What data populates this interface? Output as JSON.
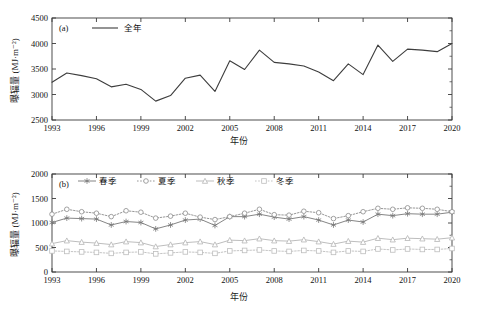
{
  "figure": {
    "background": "#ffffff",
    "axis_color": "#3a3a3a"
  },
  "panel_a": {
    "tag": "(a)",
    "ylabel": "曝辐量 (MJ·m⁻²)",
    "xlabel": "年份",
    "legend": [
      {
        "label": "全年",
        "color": "#3d3d3d",
        "marker": "none",
        "line": "solid"
      }
    ],
    "y_ticks": [
      "2500",
      "3000",
      "3500",
      "4000",
      "4500"
    ],
    "x_ticks": [
      "1993",
      "1996",
      "1999",
      "2002",
      "2005",
      "2008",
      "2011",
      "2014",
      "2017",
      "2020"
    ]
  },
  "panel_b": {
    "tag": "(b)",
    "ylabel": "曝辐量 (MJ·m⁻²)",
    "xlabel": "年份",
    "legend": [
      {
        "label": "春季",
        "color": "#777777",
        "marker": "star",
        "line": "solid"
      },
      {
        "label": "夏季",
        "color": "#8c8c8c",
        "marker": "circle",
        "line": "dotted"
      },
      {
        "label": "秋季",
        "color": "#b5b5b5",
        "marker": "triangle",
        "line": "solid"
      },
      {
        "label": "冬季",
        "color": "#bdbdbd",
        "marker": "square",
        "line": "dotted"
      }
    ],
    "y_ticks": [
      "0",
      "500",
      "1000",
      "1500",
      "2000"
    ],
    "x_ticks": [
      "1993",
      "1996",
      "1999",
      "2002",
      "2005",
      "2008",
      "2011",
      "2014",
      "2017",
      "2020"
    ]
  },
  "chart_data": [
    {
      "type": "line",
      "panel": "(a)",
      "title": "",
      "xlabel": "年份",
      "ylabel": "曝辐量 (MJ·m⁻²)",
      "xlim": [
        1993,
        2020
      ],
      "ylim": [
        2500,
        4500
      ],
      "ytick_step": 500,
      "xtick_step": 3,
      "grid": false,
      "legend_position": "top-left-inside",
      "x": [
        1993,
        1994,
        1995,
        1996,
        1997,
        1998,
        1999,
        2000,
        2001,
        2002,
        2003,
        2004,
        2005,
        2006,
        2007,
        2008,
        2009,
        2010,
        2011,
        2012,
        2013,
        2014,
        2015,
        2016,
        2017,
        2018,
        2019,
        2020
      ],
      "series": [
        {
          "name": "全年",
          "color": "#3d3d3d",
          "values": [
            3240,
            3420,
            3370,
            3310,
            3150,
            3200,
            3100,
            2870,
            2980,
            3320,
            3380,
            3060,
            3660,
            3490,
            3870,
            3630,
            3600,
            3560,
            3440,
            3270,
            3600,
            3390,
            3970,
            3650,
            3890,
            3870,
            3840,
            4000
          ]
        }
      ]
    },
    {
      "type": "line",
      "panel": "(b)",
      "title": "",
      "xlabel": "年份",
      "ylabel": "曝辐量 (MJ·m⁻²)",
      "xlim": [
        1993,
        2020
      ],
      "ylim": [
        0,
        2000
      ],
      "ytick_step": 500,
      "xtick_step": 3,
      "grid": false,
      "legend_position": "top-inside",
      "x": [
        1993,
        1994,
        1995,
        1996,
        1997,
        1998,
        1999,
        2000,
        2001,
        2002,
        2003,
        2004,
        2005,
        2006,
        2007,
        2008,
        2009,
        2010,
        2011,
        2012,
        2013,
        2014,
        2015,
        2016,
        2017,
        2018,
        2019,
        2020
      ],
      "series": [
        {
          "name": "春季",
          "color": "#777777",
          "marker": "star",
          "line": "solid",
          "values": [
            1010,
            1100,
            1090,
            1080,
            960,
            1030,
            1010,
            880,
            960,
            1060,
            1080,
            950,
            1130,
            1130,
            1180,
            1120,
            1080,
            1130,
            1060,
            960,
            1060,
            1020,
            1180,
            1150,
            1190,
            1180,
            1180,
            1220
          ]
        },
        {
          "name": "夏季",
          "color": "#8c8c8c",
          "marker": "circle",
          "line": "dotted",
          "values": [
            1180,
            1280,
            1230,
            1200,
            1130,
            1250,
            1220,
            1100,
            1140,
            1200,
            1120,
            1070,
            1130,
            1200,
            1280,
            1170,
            1160,
            1240,
            1210,
            1090,
            1150,
            1230,
            1300,
            1280,
            1310,
            1300,
            1280,
            1230
          ]
        },
        {
          "name": "秋季",
          "color": "#b5b5b5",
          "marker": "triangle",
          "line": "solid",
          "values": [
            580,
            640,
            610,
            590,
            560,
            620,
            600,
            520,
            560,
            600,
            620,
            560,
            650,
            640,
            680,
            640,
            630,
            660,
            620,
            570,
            630,
            610,
            690,
            660,
            690,
            680,
            670,
            700
          ]
        },
        {
          "name": "冬季",
          "color": "#bdbdbd",
          "marker": "square",
          "line": "dotted",
          "values": [
            430,
            420,
            410,
            400,
            380,
            400,
            410,
            370,
            390,
            410,
            400,
            380,
            430,
            440,
            450,
            430,
            420,
            440,
            430,
            400,
            430,
            420,
            470,
            450,
            470,
            460,
            460,
            480
          ]
        }
      ]
    }
  ]
}
